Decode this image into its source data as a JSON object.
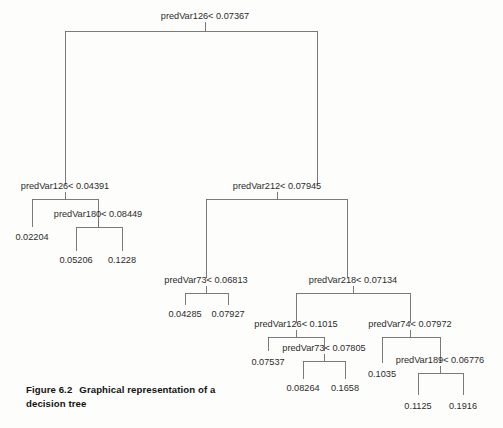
{
  "figure": {
    "caption_number": "Figure 6.2",
    "caption_text": "Graphical representation of a decision tree"
  },
  "colors": {
    "background": "#fdfdfb",
    "edge": "#6b6b6b",
    "text": "#2b2b2b",
    "caption_text": "#121212"
  },
  "chart_data": {
    "type": "diagram",
    "diagram_type": "decision-tree",
    "title": "Graphical representation of a decision tree",
    "split_operator": "<",
    "nodes": [
      {
        "id": "n0",
        "kind": "split",
        "label": "predVar126< 0.07367",
        "variable": "predVar126",
        "threshold": 0.07367,
        "x": 205,
        "y": 19,
        "bar_y": 31,
        "left_x": 65,
        "right_x": 317,
        "child_y": 185
      },
      {
        "id": "n1",
        "kind": "split",
        "label": "predVar126< 0.04391",
        "variable": "predVar126",
        "threshold": 0.04391,
        "x": 65,
        "y": 189,
        "bar_y": 199,
        "left_x": 32,
        "right_x": 98,
        "child_y": 227
      },
      {
        "id": "n2",
        "kind": "split",
        "label": "predVar212< 0.07945",
        "variable": "predVar212",
        "threshold": 0.07945,
        "x": 277,
        "y": 189,
        "bar_y": 199,
        "left_x": 206,
        "right_x": 347,
        "child_y": 278
      },
      {
        "id": "n3",
        "kind": "leaf",
        "label": "0.02204",
        "value": 0.02204,
        "x": 32,
        "y": 240
      },
      {
        "id": "n4",
        "kind": "split",
        "label": "predVar180< 0.08449",
        "variable": "predVar180",
        "threshold": 0.08449,
        "x": 98,
        "y": 217,
        "bar_y": 227,
        "left_x": 76,
        "right_x": 122,
        "child_y": 251
      },
      {
        "id": "n5",
        "kind": "leaf",
        "label": "0.05206",
        "value": 0.05206,
        "x": 76,
        "y": 263
      },
      {
        "id": "n6",
        "kind": "leaf",
        "label": "0.1228",
        "value": 0.1228,
        "x": 122,
        "y": 263
      },
      {
        "id": "n7",
        "kind": "split",
        "label": "predVar73< 0.06813",
        "variable": "predVar73",
        "threshold": 0.06813,
        "x": 206,
        "y": 283,
        "bar_y": 293,
        "left_x": 185,
        "right_x": 228,
        "child_y": 305
      },
      {
        "id": "n8",
        "kind": "leaf",
        "label": "0.04285",
        "value": 0.04285,
        "x": 185,
        "y": 317
      },
      {
        "id": "n9",
        "kind": "leaf",
        "label": "0.07927",
        "value": 0.07927,
        "x": 228,
        "y": 317
      },
      {
        "id": "n10",
        "kind": "split",
        "label": "predVar218< 0.07134",
        "variable": "predVar218",
        "threshold": 0.07134,
        "x": 353,
        "y": 283,
        "bar_y": 293,
        "left_x": 296,
        "right_x": 410,
        "child_y": 323
      },
      {
        "id": "n11",
        "kind": "split",
        "label": "predVar126< 0.1015",
        "variable": "predVar126",
        "threshold": 0.1015,
        "x": 296,
        "y": 327,
        "bar_y": 337,
        "left_x": 268,
        "right_x": 324,
        "child_y": 351
      },
      {
        "id": "n12",
        "kind": "leaf",
        "label": "0.07537",
        "value": 0.07537,
        "x": 268,
        "y": 365
      },
      {
        "id": "n13",
        "kind": "split",
        "label": "predVar73< 0.07805",
        "variable": "predVar73",
        "threshold": 0.07805,
        "x": 324,
        "y": 351,
        "bar_y": 361,
        "left_x": 303,
        "right_x": 345,
        "child_y": 379
      },
      {
        "id": "n14",
        "kind": "leaf",
        "label": "0.08264",
        "value": 0.08264,
        "x": 303,
        "y": 391
      },
      {
        "id": "n15",
        "kind": "leaf",
        "label": "0.1658",
        "value": 0.1658,
        "x": 345,
        "y": 391
      },
      {
        "id": "n16",
        "kind": "split",
        "label": "predVar74< 0.07972",
        "variable": "predVar74",
        "threshold": 0.07972,
        "x": 410,
        "y": 327,
        "bar_y": 337,
        "left_x": 382,
        "right_x": 440,
        "child_y": 363
      },
      {
        "id": "n17",
        "kind": "leaf",
        "label": "0.1035",
        "value": 0.1035,
        "x": 382,
        "y": 377
      },
      {
        "id": "n18",
        "kind": "split",
        "label": "predVar189< 0.06776",
        "variable": "predVar189",
        "threshold": 0.06776,
        "x": 440,
        "y": 363,
        "bar_y": 373,
        "left_x": 418,
        "right_x": 463,
        "child_y": 395
      },
      {
        "id": "n19",
        "kind": "leaf",
        "label": "0.1125",
        "value": 0.1125,
        "x": 418,
        "y": 409
      },
      {
        "id": "n20",
        "kind": "leaf",
        "label": "0.1916",
        "value": 0.1916,
        "x": 463,
        "y": 409
      }
    ],
    "edges": [
      {
        "parent": "n0",
        "left": "n1",
        "right": "n2"
      },
      {
        "parent": "n1",
        "left": "n3",
        "right": "n4"
      },
      {
        "parent": "n4",
        "left": "n5",
        "right": "n6"
      },
      {
        "parent": "n2",
        "left": "n7",
        "right": "n10"
      },
      {
        "parent": "n7",
        "left": "n8",
        "right": "n9"
      },
      {
        "parent": "n10",
        "left": "n11",
        "right": "n16"
      },
      {
        "parent": "n11",
        "left": "n12",
        "right": "n13"
      },
      {
        "parent": "n13",
        "left": "n14",
        "right": "n15"
      },
      {
        "parent": "n16",
        "left": "n17",
        "right": "n18"
      },
      {
        "parent": "n18",
        "left": "n19",
        "right": "n20"
      }
    ]
  }
}
